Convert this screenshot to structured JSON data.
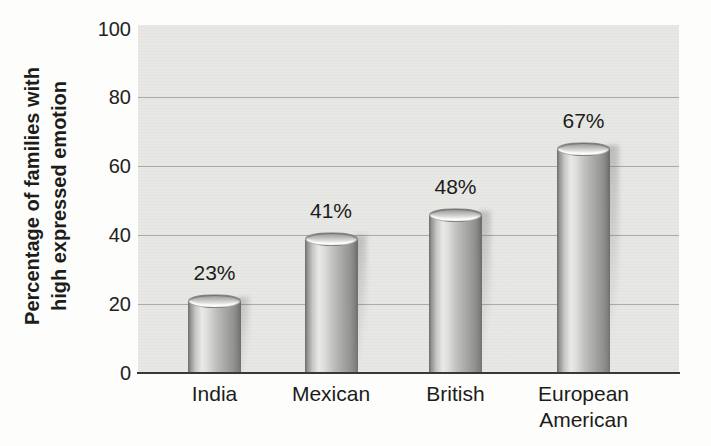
{
  "chart_data": {
    "type": "bar",
    "bar_style": "3d-cylinder-gray",
    "title": "",
    "categories": [
      "India",
      "Mexican",
      "British",
      "European American"
    ],
    "values": [
      23,
      41,
      48,
      67
    ],
    "bar_labels": [
      "23%",
      "41%",
      "48%",
      "67%"
    ],
    "xlabel": "",
    "ylabel": "Percentage of families with high expressed emotion",
    "ylabel_lines": [
      "Percentage of families with",
      "high expressed emotion"
    ],
    "yticks": [
      0,
      20,
      40,
      60,
      80,
      100
    ],
    "ylim": [
      0,
      100
    ],
    "grid": "horizontal",
    "legend": "none",
    "colors": {
      "page_bg": "#fdfdfc",
      "panel_bg": "#e7e7e4",
      "gridline": "#9f9f9d",
      "baseline": "#383836",
      "text": "#1c1c1a"
    }
  }
}
